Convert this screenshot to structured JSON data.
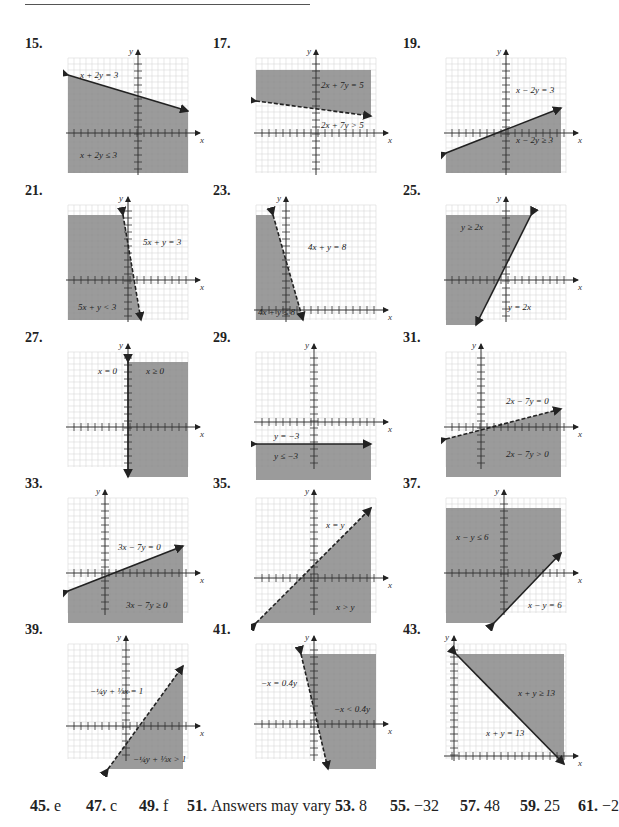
{
  "problems": [
    {
      "number": "15.",
      "eq": "x + 2y = 3",
      "ineq": "x + 2y ≤ 3"
    },
    {
      "number": "17.",
      "eq": "2x + 7y = 5",
      "ineq": "2x + 7y > 5"
    },
    {
      "number": "19.",
      "eq": "x − 2y = 3",
      "ineq": "x − 2y ≥ 3"
    },
    {
      "number": "21.",
      "eq": "5x + y = 3",
      "ineq": "5x + y < 3"
    },
    {
      "number": "23.",
      "eq": "4x + y = 8",
      "ineq": "4x + y ≤ 8"
    },
    {
      "number": "25.",
      "eq": "y = 2x",
      "ineq": "y ≥ 2x"
    },
    {
      "number": "27.",
      "eq": "x = 0",
      "ineq": "x ≥ 0"
    },
    {
      "number": "29.",
      "eq": "y = −3",
      "ineq": "y ≤ −3"
    },
    {
      "number": "31.",
      "eq": "2x − 7y = 0",
      "ineq": "2x − 7y > 0"
    },
    {
      "number": "33.",
      "eq": "3x − 7y = 0",
      "ineq": "3x − 7y ≥ 0"
    },
    {
      "number": "35.",
      "eq": "x = y",
      "ineq": "x > y"
    },
    {
      "number": "37.",
      "eq": "x − y = 6",
      "ineq": "x − y ≤ 6"
    },
    {
      "number": "39.",
      "eq": "−¼y + ⅓x = 1",
      "ineq": "−¼y + ⅓x > 1"
    },
    {
      "number": "41.",
      "eq": "−x = 0.4y",
      "ineq": "−x < 0.4y"
    },
    {
      "number": "43.",
      "eq": "x + y = 13",
      "ineq": "x + y ≥ 13"
    }
  ],
  "axis": {
    "x_label": "x",
    "y_label": "y"
  },
  "answers": [
    {
      "number": "45.",
      "value": "e"
    },
    {
      "number": "47.",
      "value": "c"
    },
    {
      "number": "49.",
      "value": "f"
    },
    {
      "number": "51.",
      "value": "Answers may vary"
    },
    {
      "number": "53.",
      "value": "8"
    },
    {
      "number": "55.",
      "value": "−32"
    },
    {
      "number": "57.",
      "value": "48"
    },
    {
      "number": "59.",
      "value": "25"
    },
    {
      "number": "61.",
      "value": "−2"
    }
  ],
  "colors": {
    "shade": "#8a8a8a",
    "grid": "#d8d8d8",
    "line": "#222222"
  }
}
